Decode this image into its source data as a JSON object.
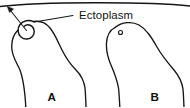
{
  "figure": {
    "background_color": "#ffffff",
    "ink_color": "#161616",
    "width": 190,
    "height": 107,
    "callout": {
      "label": "Ectoplasm",
      "target": "pseudopod-circle-cell-a",
      "leader_from": [
        74,
        15
      ],
      "leader_to": [
        33,
        24
      ]
    },
    "arrow": {
      "name": "direction-arrow",
      "from": [
        26,
        30
      ],
      "to": [
        8,
        8
      ],
      "points": "up-left"
    },
    "panels": [
      {
        "id": "a",
        "letter": "A",
        "letter_position": [
          52,
          98
        ],
        "has_pseudopod_circle": true,
        "has_vacuole_dot": false,
        "description": "Amoeboid cell with circular ectoplasmic pseudopod at upper left"
      },
      {
        "id": "b",
        "letter": "B",
        "letter_position": [
          155,
          98
        ],
        "has_pseudopod_circle": false,
        "has_vacuole_dot": true,
        "vacuole_position": [
          120,
          32
        ],
        "description": "Amoeboid cell with smooth rounded anterior and small vacuole"
      }
    ],
    "top_rule": {
      "name": "top-border-rule",
      "shape": "shallow-arc",
      "left_end": [
        0,
        6
      ],
      "apex": [
        95,
        2
      ],
      "right_end": [
        190,
        6
      ]
    }
  }
}
